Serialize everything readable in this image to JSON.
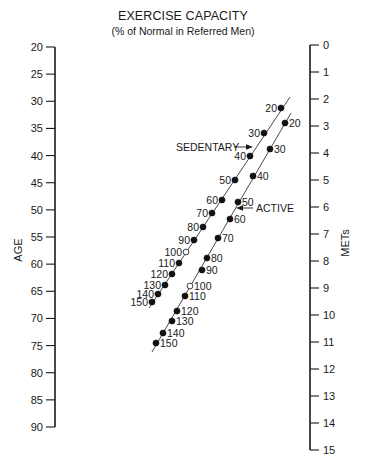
{
  "chart_data": {
    "type": "nomogram",
    "title": "EXERCISE CAPACITY",
    "subtitle": "(% of Normal in Referred Men)",
    "left_axis": {
      "label": "AGE",
      "ticks": [
        20,
        25,
        30,
        35,
        40,
        45,
        50,
        55,
        60,
        65,
        70,
        75,
        80,
        85,
        90
      ],
      "range": [
        20,
        90
      ]
    },
    "right_axis": {
      "label": "METs",
      "ticks": [
        0,
        1,
        2,
        3,
        4,
        5,
        6,
        7,
        8,
        9,
        10,
        11,
        12,
        13,
        14,
        15
      ],
      "range": [
        0,
        15
      ]
    },
    "series": [
      {
        "name": "SEDENTARY",
        "percent_labels": [
          20,
          30,
          40,
          50,
          60,
          70,
          80,
          90,
          100,
          110,
          120,
          130,
          140,
          150
        ],
        "open_marker_at": 100,
        "label_side": "left"
      },
      {
        "name": "ACTIVE",
        "percent_labels": [
          20,
          30,
          40,
          50,
          60,
          70,
          80,
          90,
          100,
          110,
          120,
          130,
          140,
          150
        ],
        "open_marker_at": 100,
        "label_side": "right"
      }
    ],
    "annotations": [
      {
        "text": "SEDENTARY",
        "arrow": "right",
        "points_to": "SEDENTARY line near 40%"
      },
      {
        "text": "ACTIVE",
        "arrow": "left",
        "points_to": "ACTIVE line near 50%"
      }
    ]
  }
}
